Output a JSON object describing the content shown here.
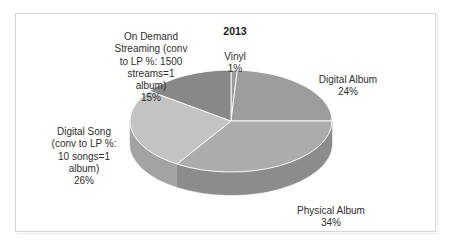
{
  "chart_data": {
    "type": "pie",
    "title": "2013",
    "subtitle": "",
    "xlabel": "",
    "ylabel": "",
    "legend_position": "none",
    "three_d": true,
    "units": "percent",
    "categories": [
      "Vinyl",
      "Digital Album",
      "Physical Album",
      "Digital Song (conv to LP %: 10 songs=1 album)",
      "On Demand Streaming (conv to LP %: 1500 streams=1 album)"
    ],
    "values": [
      1,
      24,
      34,
      26,
      15
    ],
    "slices": [
      {
        "name": "Vinyl",
        "label_text": "Vinyl",
        "value": 1,
        "value_label": "1%",
        "color": "#9b9b9b",
        "side_color": "#7b7b7b",
        "start_pct": 0,
        "end_pct": 1
      },
      {
        "name": "Digital Album",
        "label_text": "Digital Album",
        "value": 24,
        "value_label": "24%",
        "color": "#9d9d9d",
        "side_color": "#7d7d7d",
        "start_pct": 1,
        "end_pct": 25
      },
      {
        "name": "Physical Album",
        "label_text": "Physical Album",
        "value": 34,
        "value_label": "34%",
        "color": "#acacac",
        "side_color": "#8c8c8c",
        "start_pct": 25,
        "end_pct": 59
      },
      {
        "name": "Digital Song",
        "label_text": "Digital Song\n(conv to LP %:\n10 songs=1\nalbum)",
        "value": 26,
        "value_label": "26%",
        "color": "#c3c3c3",
        "side_color": "#a3a3a3",
        "start_pct": 59,
        "end_pct": 85
      },
      {
        "name": "On Demand Streaming",
        "label_text": "On Demand\nStreaming (conv\nto LP %: 1500\nstreams=1\nalbum)",
        "value": 15,
        "value_label": "15%",
        "color": "#888888",
        "side_color": "#6a6a6a",
        "start_pct": 85,
        "end_pct": 100
      }
    ]
  },
  "labels": {
    "on_demand": {
      "text": "On Demand\nStreaming (conv\nto LP %: 1500\nstreams=1\nalbum)",
      "pct": "15%"
    },
    "vinyl": {
      "text": "Vinyl",
      "pct": "1%"
    },
    "digital_album": {
      "text": "Digital Album",
      "pct": "24%"
    },
    "digital_song": {
      "text": "Digital Song\n(conv to LP %:\n10 songs=1\nalbum)",
      "pct": "26%"
    },
    "physical_album": {
      "text": "Physical Album",
      "pct": "34%"
    }
  },
  "title": "2013",
  "colors": {
    "background": "#ffffff",
    "frame": "#d4d4d4",
    "text": "#2e2e2e",
    "title_text": "#1a1a1a"
  }
}
